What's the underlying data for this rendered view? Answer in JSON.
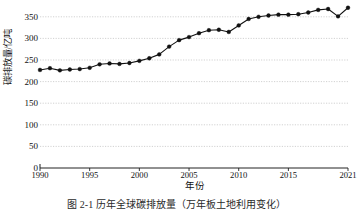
{
  "figure": {
    "ylabel": "碳排放量/亿吨",
    "xlabel": "年份",
    "caption": "图 2-1  历年全球碳排放量（万年板土地利用变化）"
  },
  "axes": {
    "y_ticks": [
      "0",
      "50",
      "100",
      "150",
      "200",
      "250",
      "300",
      "350"
    ],
    "x_ticks": [
      "1990",
      "1995",
      "2000",
      "2005",
      "2010",
      "2015",
      "2021"
    ]
  },
  "chart_data": {
    "type": "line",
    "title": "",
    "xlabel": "年份",
    "ylabel": "碳排放量/亿吨",
    "xlim": [
      1990,
      2021
    ],
    "ylim": [
      0,
      375
    ],
    "grid": true,
    "legend": null,
    "marker": "filled-circle",
    "line_color": "#111111",
    "marker_color": "#111111",
    "grid_color": "#bfbfbf",
    "x": [
      1990,
      1991,
      1992,
      1993,
      1994,
      1995,
      1996,
      1997,
      1998,
      1999,
      2000,
      2001,
      2002,
      2003,
      2004,
      2005,
      2006,
      2007,
      2008,
      2009,
      2010,
      2011,
      2012,
      2013,
      2014,
      2015,
      2016,
      2017,
      2018,
      2019,
      2020,
      2021
    ],
    "y": [
      227,
      231,
      226,
      228,
      229,
      232,
      240,
      242,
      241,
      243,
      248,
      254,
      263,
      281,
      296,
      303,
      312,
      319,
      320,
      315,
      330,
      345,
      350,
      353,
      355,
      355,
      356,
      360,
      366,
      368,
      351,
      371
    ],
    "series": [
      {
        "name": "全球碳排放量",
        "values": [
          227,
          231,
          226,
          228,
          229,
          232,
          240,
          242,
          241,
          243,
          248,
          254,
          263,
          281,
          296,
          303,
          312,
          319,
          320,
          315,
          330,
          345,
          350,
          353,
          355,
          355,
          356,
          360,
          366,
          368,
          351,
          371
        ]
      }
    ]
  }
}
